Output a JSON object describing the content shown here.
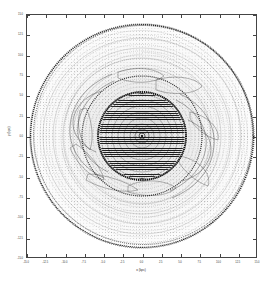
{
  "figure": {
    "kind": "contour-vector-plot",
    "background_color": "#ffffff",
    "frame_color": "#444444"
  },
  "chart_data": {
    "type": "contour",
    "title": "",
    "subtitle": "",
    "xlabel": "x (kpc)",
    "ylabel": "y (kpc)",
    "xlim": [
      -15.0,
      15.0
    ],
    "ylim": [
      -15.0,
      15.0
    ],
    "grid": false,
    "legend": "none",
    "xticks": [
      -15.0,
      -12.5,
      -10.0,
      -7.5,
      -5.0,
      -2.5,
      0.0,
      2.5,
      5.0,
      7.5,
      10.0,
      12.5,
      15.0
    ],
    "xticklabels": [
      "-15.0",
      "-12.5",
      "-10.0",
      "-7.5",
      "-5.0",
      "-2.5",
      "0.0",
      "2.5",
      "5.0",
      "7.5",
      "10.0",
      "12.5",
      "15.0"
    ],
    "yticks": [
      -15.0,
      -12.5,
      -10.0,
      -7.5,
      -5.0,
      -2.5,
      0.0,
      2.5,
      5.0,
      7.5,
      10.0,
      12.5,
      15.0
    ],
    "yticklabels": [
      "-15.0",
      "-12.5",
      "-10.0",
      "-7.5",
      "-5.0",
      "-2.5",
      "0.0",
      "2.5",
      "5.0",
      "7.5",
      "10.0",
      "12.5",
      "15.0"
    ],
    "center": {
      "x": 0.0,
      "y": 0.0
    },
    "disk_radius_kpc": 14.0,
    "core_radius_kpc": 5.2,
    "contour_levels_radius_kpc": [
      1.0,
      1.8,
      2.6,
      3.4,
      4.2,
      5.0,
      5.8,
      6.8,
      7.8,
      8.8,
      9.8,
      10.8,
      11.8,
      12.6,
      13.4,
      14.0
    ],
    "features": [
      {
        "name": "central-core",
        "radius_kpc": 5.2,
        "shading": "dense"
      },
      {
        "name": "inner-ring",
        "radius_kpc": 7.6,
        "shading": "dark-rim"
      },
      {
        "name": "spiral-arm-1",
        "pitch_deg": 22,
        "start_r_kpc": 5.5,
        "end_r_kpc": 13.0
      },
      {
        "name": "spiral-arm-2",
        "pitch_deg": 22,
        "start_r_kpc": 5.5,
        "end_r_kpc": 13.0
      },
      {
        "name": "outer-rim",
        "radius_kpc": 14.0,
        "shading": "dark-rim"
      }
    ]
  }
}
